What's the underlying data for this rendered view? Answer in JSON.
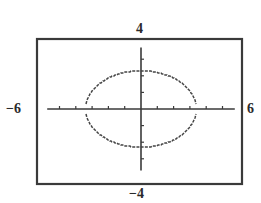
{
  "chart_data": {
    "type": "line",
    "title": "",
    "xlabel": "",
    "ylabel": "",
    "xlim": [
      -6,
      6
    ],
    "ylim": [
      -4,
      4
    ],
    "x_tick_step": 1,
    "y_tick_step": 1,
    "grid": false,
    "legend": null,
    "window_labels": {
      "xmin": "−6",
      "xmax": "6",
      "ymin": "−4",
      "ymax": "4"
    },
    "series": [
      {
        "name": "ellipse",
        "shape": "ellipse",
        "center": [
          0,
          0
        ],
        "semi_axis_x": 3.4,
        "semi_axis_y": 2.3,
        "style": "stepped-dotted",
        "gap_near_x_axis": true
      }
    ]
  },
  "colors": {
    "frame": "#3a3a3a",
    "axis": "#3a3a3a",
    "curve": "#444444",
    "background": "#ffffff"
  }
}
